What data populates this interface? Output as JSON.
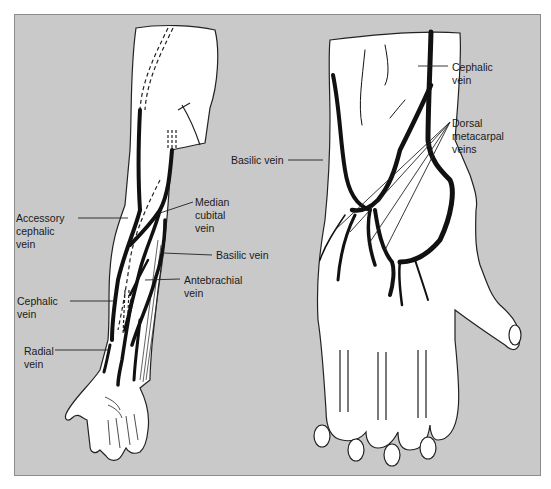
{
  "figure": {
    "panels": [
      {
        "name": "forearm-view",
        "description": "Anterior forearm and palm"
      },
      {
        "name": "hand-dorsum-view",
        "description": "Dorsum of hand"
      }
    ],
    "forearm_labels": {
      "accessory_cephalic": "Accessory\ncephalic\nvein",
      "median_cubital": "Median\ncubital\nvein",
      "basilic": "Basilic vein",
      "antebrachial": "Antebrachial\nvein",
      "cephalic": "Cephalic\nvein",
      "radial": "Radial\nvein"
    },
    "hand_labels": {
      "cephalic": "Cephalic\nvein",
      "dorsal_metacarpal": "Dorsal\nmetacarpal\nveins",
      "basilic": "Basilic vein"
    },
    "colors": {
      "background": "#c9c9c9",
      "skin": "#ffffff",
      "vein": "#111111",
      "outline": "#222222"
    }
  }
}
